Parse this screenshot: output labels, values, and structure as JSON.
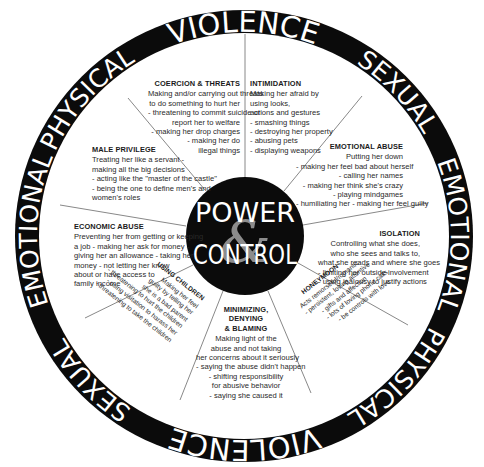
{
  "diagram": {
    "colors": {
      "ring": "#0b0b0b",
      "ring_text": "#ffffff",
      "hub": "#0b0b0b",
      "ampersand": "#8c8c8c",
      "body_text": "#2a2a2a",
      "spokes": "#555555",
      "background": "#ffffff"
    },
    "hub": {
      "line1": "POWER",
      "amp": "&",
      "line2": "CONTROL"
    },
    "outer_ring": {
      "top": "VIOLENCE",
      "upper_left": "PHYSICAL",
      "upper_right": "SEXUAL",
      "left": "EMOTIONAL",
      "right": "EMOTIONAL",
      "lower_left": "SEXUAL",
      "lower_right": "PHYSICAL",
      "bottom": "VIOLENCE"
    },
    "segments": [
      {
        "id": "coercion",
        "title": "COERCION & THREATS",
        "lines": [
          "Making and/or carrying out threats",
          "to do something to hurt her",
          "- threatening to commit suicide or",
          "report her to welfare",
          "- making her drop charges",
          "- making her do",
          "illegal things"
        ]
      },
      {
        "id": "intimidation",
        "title": "INTIMIDATION",
        "lines": [
          "Making her afraid by",
          "using looks,",
          "actions and gestures",
          "- smashing things",
          "- destroying her property",
          "- abusing pets",
          "- displaying weapons"
        ]
      },
      {
        "id": "emotional_abuse",
        "title": "EMOTIONAL ABUSE",
        "lines": [
          "Putting her down",
          "- making her feel bad about herself",
          "- calling her names",
          "- making her think she's crazy",
          "- playing mindgames",
          "- humiliating her - making her feel guilty"
        ]
      },
      {
        "id": "isolation",
        "title": "ISOLATION",
        "lines": [
          "Controlling what she does,",
          "who she sees and talks to,",
          "what she reads and where she goes",
          "- limiting her outside involvement",
          "- using jealousy to justify actions"
        ]
      },
      {
        "id": "honeymoon",
        "title": "HONEYMOON",
        "lines": [
          "Acts remorseful/romantic",
          "- persistent, loving attentive",
          "- gifts and affection",
          "- lots of loving phone calls",
          "- be controls with love"
        ]
      },
      {
        "id": "minimizing",
        "title_lines": [
          "MINIMIZING,",
          "DENYING",
          "& BLAMING"
        ],
        "lines": [
          "Making light of the",
          "abuse and not taking",
          "her concerns about it seriously",
          "- saying the abuse didn't happen",
          "- shifting responsibility",
          "for abusive behavior",
          "- saying she caused it"
        ]
      },
      {
        "id": "using_children",
        "title": "USING CHILDREN",
        "lines": [
          "Making her feel",
          "guilty by telling her",
          "she is a bad parent",
          "- threatening to hurt the children",
          "- using visitation to harass her",
          "- threatening to take the children"
        ]
      },
      {
        "id": "economic_abuse",
        "title": "ECONOMIC ABUSE",
        "lines": [
          "Preventing her from getting or keeping",
          "a job - making her ask for money -",
          "giving her an allowance - taking her",
          "money - not letting her know",
          "about or have access to",
          "family income"
        ]
      },
      {
        "id": "male_privilege",
        "title": "MALE PRIVILEGE",
        "lines": [
          "Treating her like a servant -",
          "making all the big decisions",
          "- acting like the \"master of the castle\"",
          "- being the one to define men's and",
          "women's roles"
        ]
      }
    ]
  }
}
